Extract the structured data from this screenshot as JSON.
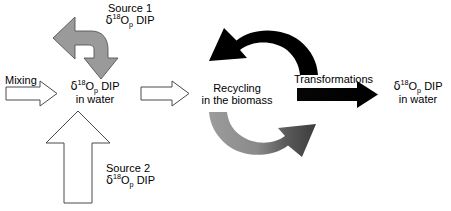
{
  "diagram": {
    "nodes": {
      "source1": {
        "name_line": "Source 1",
        "isotope": {
          "delta": "δ",
          "mass": "18",
          "element": "O",
          "sub": "p",
          "species": "DIP"
        }
      },
      "source2": {
        "name_line": "Source 2",
        "isotope": {
          "delta": "δ",
          "mass": "18",
          "element": "O",
          "sub": "p",
          "species": "DIP"
        }
      },
      "water_pool": {
        "isotope": {
          "delta": "δ",
          "mass": "18",
          "element": "O",
          "sub": "p",
          "species": "DIP"
        },
        "medium": "in water"
      },
      "biomass": {
        "line1": "Recycling",
        "line2": "in the biomass"
      },
      "output_pool": {
        "isotope": {
          "delta": "δ",
          "mass": "18",
          "element": "O",
          "sub": "p",
          "species": "DIP"
        },
        "medium": "in water"
      }
    },
    "processes": {
      "mixing": "Mixing",
      "transformations": "Transformations"
    },
    "colors": {
      "arrow_gray_fill": "#9a9a9a",
      "arrow_gray_dark_fill": "#4d4d4d",
      "arrow_black_fill": "#000000",
      "arrow_white_fill": "#ffffff",
      "arrow_outline": "#3a3a3a",
      "text": "#000000",
      "background": "#ffffff"
    }
  }
}
